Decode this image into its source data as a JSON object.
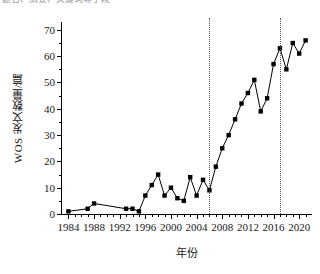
{
  "top_clipped_text": "题名、摘要、关键词等字段",
  "chart_data": {
    "type": "line",
    "title": "",
    "xlabel": "年份",
    "ylabel": "WOS 发文数量/篇",
    "xlim": [
      1983,
      2022
    ],
    "ylim": [
      0,
      73
    ],
    "grid": false,
    "legend": null,
    "marker": "filled-square",
    "line_color": "#000000",
    "marker_color": "#000000",
    "x_tick_labels": [
      "1984",
      "1988",
      "1992",
      "1996",
      "2000",
      "2004",
      "2008",
      "2012",
      "2016",
      "2020"
    ],
    "x_tick_values": [
      1984,
      1988,
      1992,
      1996,
      2000,
      2004,
      2008,
      2012,
      2016,
      2020
    ],
    "x_minor_step": 1,
    "y_tick_labels": [
      "0",
      "10",
      "20",
      "30",
      "40",
      "50",
      "60",
      "70"
    ],
    "y_tick_values": [
      0,
      10,
      20,
      30,
      40,
      50,
      60,
      70
    ],
    "y_minor_step": 5,
    "x": [
      1984,
      1987,
      1988,
      1993,
      1994,
      1995,
      1996,
      1997,
      1998,
      1999,
      2000,
      2001,
      2002,
      2003,
      2004,
      2005,
      2006,
      2007,
      2008,
      2009,
      2010,
      2011,
      2012,
      2013,
      2014,
      2015,
      2016,
      2017,
      2018,
      2019,
      2020,
      2021
    ],
    "values": [
      1,
      2,
      4,
      2,
      2,
      1,
      7,
      11,
      15,
      7,
      10,
      6,
      5,
      14,
      7,
      13,
      9,
      18,
      25,
      30,
      36,
      42,
      46,
      51,
      39,
      44,
      57,
      63,
      55,
      65,
      61,
      66
    ],
    "annotations": [
      {
        "type": "vertical-dotted-line",
        "x": 2006,
        "style": "dotted",
        "color": "#555555"
      },
      {
        "type": "vertical-dotted-line",
        "x": 2017,
        "style": "dotted",
        "color": "#555555"
      }
    ]
  }
}
